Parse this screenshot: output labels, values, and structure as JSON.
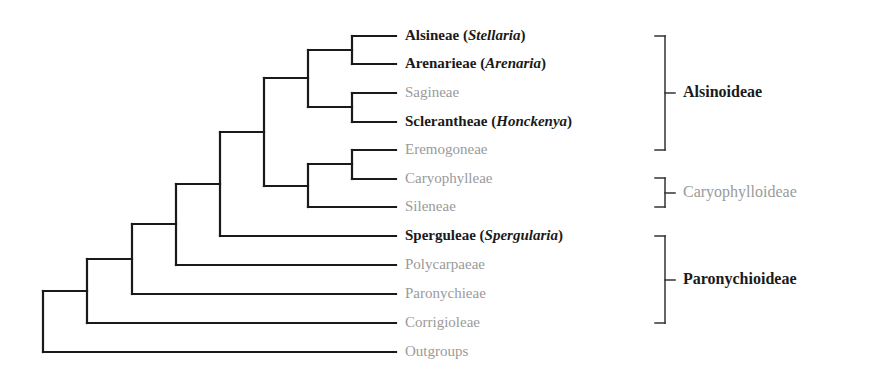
{
  "diagram": {
    "type": "cladogram",
    "line_color": "#1a1a1a",
    "bracket_color": "#333333",
    "muted_color": "#9a9a9a",
    "label_x": 405,
    "leaf_end_x": 396,
    "leaves": [
      {
        "name": "Alsineae",
        "genus": "Stellaria",
        "y": 36,
        "emphasis": "bold"
      },
      {
        "name": "Arenarieae",
        "genus": "Arenaria",
        "y": 64,
        "emphasis": "bold"
      },
      {
        "name": "Sagineae",
        "genus": "",
        "y": 93,
        "emphasis": "muted"
      },
      {
        "name": "Sclerantheae",
        "genus": "Honckenya",
        "y": 122,
        "emphasis": "bold"
      },
      {
        "name": "Eremogoneae",
        "genus": "",
        "y": 150,
        "emphasis": "muted"
      },
      {
        "name": "Caryophylleae",
        "genus": "",
        "y": 179,
        "emphasis": "muted"
      },
      {
        "name": "Sileneae",
        "genus": "",
        "y": 207,
        "emphasis": "muted"
      },
      {
        "name": "Sperguleae",
        "genus": "Spergularia",
        "y": 236,
        "emphasis": "bold"
      },
      {
        "name": "Polycarpaeae",
        "genus": "",
        "y": 265,
        "emphasis": "muted"
      },
      {
        "name": "Paronychieae",
        "genus": "",
        "y": 294,
        "emphasis": "muted"
      },
      {
        "name": "Corrigioleae",
        "genus": "",
        "y": 323,
        "emphasis": "muted"
      },
      {
        "name": "Outgroups",
        "genus": "",
        "y": 352,
        "emphasis": "muted"
      }
    ],
    "nodes": [
      {
        "x": 352,
        "top": 36,
        "bottom": 64
      },
      {
        "x": 352,
        "top": 93,
        "bottom": 122
      },
      {
        "x": 308,
        "top": 50,
        "bottom": 107
      },
      {
        "x": 352,
        "top": 150,
        "bottom": 179
      },
      {
        "x": 308,
        "top": 164,
        "bottom": 207
      },
      {
        "x": 264,
        "top": 78,
        "bottom": 186
      },
      {
        "x": 220,
        "top": 132,
        "bottom": 236
      },
      {
        "x": 176,
        "top": 184,
        "bottom": 265
      },
      {
        "x": 132,
        "top": 224,
        "bottom": 294
      },
      {
        "x": 87,
        "top": 259,
        "bottom": 323
      },
      {
        "x": 43,
        "top": 291,
        "bottom": 352
      }
    ],
    "groups": [
      {
        "name": "Alsinoideae",
        "top": 36,
        "bottom": 150,
        "emphasis": "bold"
      },
      {
        "name": "Caryophylloideae",
        "top": 178,
        "bottom": 207,
        "emphasis": "muted"
      },
      {
        "name": "Paronychioideae",
        "top": 236,
        "bottom": 323,
        "emphasis": "bold"
      }
    ]
  }
}
